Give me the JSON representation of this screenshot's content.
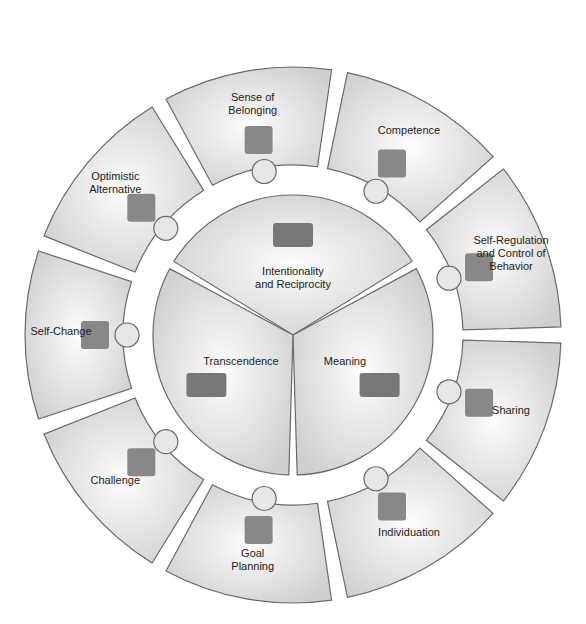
{
  "diagram": {
    "outer_pieces": [
      {
        "label": [
          "Sense of",
          "Belonging"
        ],
        "icon": "people-circle-icon"
      },
      {
        "label": [
          "Competence"
        ],
        "icon": "award-ribbon-icon",
        "badge": "1"
      },
      {
        "label": [
          "Self-Regulation",
          "and Control of",
          "Behavior"
        ],
        "icon": "traffic-light-icon"
      },
      {
        "label": [
          "Sharing"
        ],
        "icon": "interlocking-rings-icon"
      },
      {
        "label": [
          "Individuation"
        ],
        "icon": "fingerprint-hand-icon"
      },
      {
        "label": [
          "Goal",
          "Planning"
        ],
        "icon": "target-icon"
      },
      {
        "label": [
          "Challenge"
        ],
        "icon": "mountain-icon"
      },
      {
        "label": [
          "Self-Change"
        ],
        "icon": "rising-graph-icon"
      },
      {
        "label": [
          "Optimistic",
          "Alternative"
        ],
        "icon": "glass-icon"
      }
    ],
    "inner_pieces": [
      {
        "label": [
          "Intentionality",
          "and Reciprocity"
        ],
        "icon": "handshake-icon"
      },
      {
        "label": [
          "Meaning"
        ],
        "icon": "key-icon"
      },
      {
        "label": [
          "Transcendence"
        ],
        "icon": "bridge-icon"
      }
    ]
  }
}
